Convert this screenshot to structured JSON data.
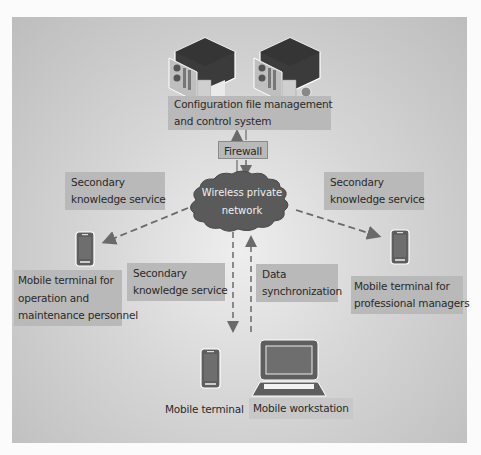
{
  "diagram": {
    "nodes": {
      "server_system": {
        "label_line1": "Configuration file management",
        "label_line2": "and control system",
        "icon": "server-rack-icon",
        "count": 2
      },
      "firewall": {
        "label": "Firewall"
      },
      "network": {
        "label_line1": "Wireless private",
        "label_line2": "network",
        "icon": "cloud-icon"
      },
      "ops_terminal": {
        "label_line1": "Mobile terminal for",
        "label_line2": "operation and",
        "label_line3": "maintenance personnel",
        "icon": "smartphone-icon"
      },
      "manager_terminal": {
        "label_line1": "Mobile terminal for",
        "label_line2": "professional managers",
        "icon": "smartphone-icon"
      },
      "mobile_terminal": {
        "label": "Mobile terminal",
        "icon": "smartphone-icon"
      },
      "mobile_workstation": {
        "label": "Mobile workstation",
        "icon": "laptop-icon"
      }
    },
    "edges": {
      "left_service": {
        "label_line1": "Secondary",
        "label_line2": "knowledge service",
        "from": "network",
        "to": "ops_terminal",
        "style": "dashed"
      },
      "right_service": {
        "label_line1": "Secondary",
        "label_line2": "knowledge service",
        "from": "network",
        "to": "manager_terminal",
        "style": "dashed"
      },
      "down_service": {
        "label_line1": "Secondary",
        "label_line2": "knowledge service",
        "from": "network",
        "to": "mobile_terminal",
        "style": "dashed"
      },
      "sync": {
        "label_line1": "Data",
        "label_line2": "synchronization",
        "from": "mobile_workstation",
        "to": "network",
        "style": "dashed"
      },
      "firewall_up": {
        "from": "firewall",
        "to": "server_system",
        "style": "solid"
      },
      "firewall_down": {
        "from": "firewall",
        "to": "network",
        "style": "solid"
      }
    },
    "colors": {
      "label_bg": "#b9b9b9",
      "cloud": "#5a5a5a",
      "arrow": "#6a6a6a",
      "device": "#5e5e5e"
    }
  }
}
